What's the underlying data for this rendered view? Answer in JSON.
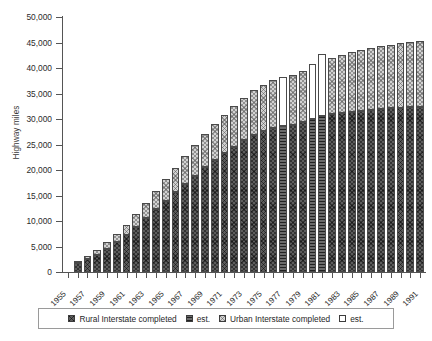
{
  "chart_data": {
    "type": "bar",
    "title": "",
    "subtitle": "",
    "xlabel": "",
    "ylabel": "Highway miles",
    "ylim": [
      0,
      50000
    ],
    "ytick_labels": [
      "0",
      "5,000",
      "10,000",
      "15,000",
      "20,000",
      "25,000",
      "30,000",
      "35,000",
      "40,000",
      "45,000",
      "50,000"
    ],
    "ytick_values": [
      0,
      5000,
      10000,
      15000,
      20000,
      25000,
      30000,
      35000,
      40000,
      45000,
      50000
    ],
    "grid": false,
    "stacked": true,
    "legend_position": "bottom",
    "legend": [
      {
        "label": "Rural Interstate completed",
        "key": "rural_done",
        "swatch": "dark-crosshatch"
      },
      {
        "label": "est.",
        "key": "rural_est",
        "swatch": "dark-lines"
      },
      {
        "label": "Urban Interstate completed",
        "key": "urban_done",
        "swatch": "light-checker"
      },
      {
        "label": "est.",
        "key": "urban_est",
        "swatch": "white"
      }
    ],
    "categories": [
      "1955",
      "1956",
      "1957",
      "1958",
      "1959",
      "1960",
      "1961",
      "1962",
      "1963",
      "1964",
      "1965",
      "1966",
      "1967",
      "1968",
      "1969",
      "1970",
      "1971",
      "1972",
      "1973",
      "1974",
      "1975",
      "1976",
      "1977",
      "1978",
      "1979",
      "1980",
      "1981",
      "1982",
      "1983",
      "1984",
      "1985",
      "1986",
      "1987",
      "1988",
      "1989",
      "1990",
      "1991"
    ],
    "xtick_labels_shown": [
      "1955",
      "1957",
      "1959",
      "1961",
      "1963",
      "1965",
      "1967",
      "1969",
      "1971",
      "1973",
      "1975",
      "1977",
      "1979",
      "1981",
      "1983",
      "1985",
      "1987",
      "1989",
      "1991"
    ],
    "series": [
      {
        "name": "Rural Interstate completed",
        "key": "rural_done",
        "values": [
          0,
          1700,
          2500,
          3400,
          4600,
          5800,
          7300,
          8900,
          10600,
          12300,
          14000,
          15600,
          17300,
          18900,
          20500,
          21900,
          23300,
          24600,
          25900,
          26900,
          27700,
          28300,
          null,
          28800,
          29400,
          null,
          null,
          30900,
          31200,
          31400,
          31600,
          31800,
          32000,
          32150,
          32250,
          32350,
          32400
        ]
      },
      {
        "name": "Rural Interstate est.",
        "key": "rural_est",
        "values": [
          null,
          null,
          null,
          null,
          null,
          null,
          null,
          null,
          null,
          null,
          null,
          null,
          null,
          null,
          null,
          null,
          null,
          null,
          null,
          null,
          null,
          null,
          28600,
          null,
          null,
          30100,
          30500,
          null,
          null,
          null,
          null,
          null,
          null,
          null,
          null,
          null,
          null
        ]
      },
      {
        "name": "Urban Interstate completed",
        "key": "urban_done",
        "values": [
          0,
          500,
          700,
          900,
          1200,
          1600,
          2000,
          2500,
          3000,
          3600,
          4200,
          4800,
          5400,
          6000,
          6600,
          7100,
          7500,
          7900,
          8300,
          8700,
          9000,
          9300,
          null,
          9800,
          10100,
          null,
          null,
          11100,
          11400,
          11700,
          11900,
          12100,
          12300,
          12450,
          12600,
          12750,
          12900
        ]
      },
      {
        "name": "Urban Interstate est.",
        "key": "urban_est",
        "values": [
          null,
          null,
          null,
          null,
          null,
          null,
          null,
          null,
          null,
          null,
          null,
          null,
          null,
          null,
          null,
          null,
          null,
          null,
          null,
          null,
          null,
          null,
          9550,
          null,
          null,
          10700,
          12200,
          null,
          null,
          null,
          null,
          null,
          null,
          null,
          null,
          null,
          null
        ]
      }
    ],
    "totals": [
      0,
      2200,
      3200,
      4300,
      5800,
      7400,
      9300,
      11400,
      13600,
      15900,
      18200,
      20400,
      22700,
      24900,
      27100,
      29000,
      30800,
      32500,
      34200,
      35600,
      36700,
      37600,
      38150,
      38600,
      39500,
      40800,
      42700,
      42000,
      42600,
      43100,
      43500,
      43900,
      44300,
      44600,
      44850,
      45100,
      45300
    ]
  }
}
